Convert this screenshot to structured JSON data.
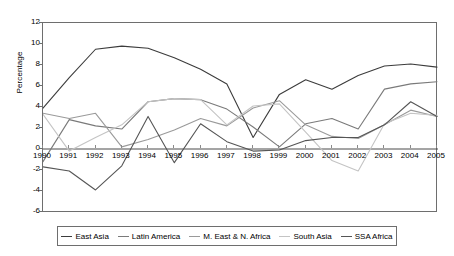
{
  "chart_data": {
    "type": "line",
    "title": "",
    "xlabel": "",
    "ylabel": "Percentage",
    "grid": false,
    "legend_position": "bottom",
    "x": [
      1990,
      1991,
      1992,
      1993,
      1994,
      1995,
      1996,
      1997,
      1998,
      1999,
      2000,
      2001,
      2002,
      2003,
      2004,
      2005
    ],
    "xtick_labels": [
      "1990",
      "1991",
      "1992",
      "1993",
      "1994",
      "1995",
      "1996",
      "1997",
      "1998",
      "1999",
      "2000",
      "2001",
      "2002",
      "2003",
      "2004",
      "2005"
    ],
    "ylim": [
      -6,
      12
    ],
    "ytick_labels": [
      "12",
      "10",
      "8",
      "6",
      "4",
      "2",
      "0",
      "-2",
      "-4",
      "-6"
    ],
    "ytick_values": [
      12,
      10,
      8,
      6,
      4,
      2,
      0,
      -2,
      -4,
      -6
    ],
    "series": [
      {
        "name": "East Asia",
        "color": "#3c3c3c",
        "values": [
          3.9,
          6.8,
          9.5,
          9.8,
          9.6,
          8.7,
          7.6,
          6.2,
          1.1,
          5.2,
          6.6,
          5.7,
          7.0,
          7.9,
          8.1,
          7.8
        ]
      },
      {
        "name": "Latin America",
        "color": "#7a7a7a",
        "values": [
          -1.2,
          2.8,
          2.2,
          1.9,
          4.5,
          4.8,
          4.7,
          3.8,
          2.1,
          0.2,
          2.4,
          2.9,
          1.9,
          5.7,
          6.2,
          6.4
        ]
      },
      {
        "name": "M. East & N. Africa",
        "color": "#9a9a9a",
        "values": [
          3.4,
          2.9,
          3.4,
          0.2,
          0.9,
          1.8,
          2.9,
          2.2,
          3.9,
          4.6,
          2.3,
          1.2,
          1.0,
          2.3,
          3.7,
          3.1
        ]
      },
      {
        "name": "South Asia",
        "color": "#c4c4c4",
        "values": [
          3.3,
          -0.2,
          1.1,
          2.3,
          4.5,
          4.8,
          4.7,
          2.3,
          4.1,
          4.3,
          1.6,
          -1.1,
          -2.1,
          2.4,
          3.4,
          3.2
        ]
      },
      {
        "name": "SSA Africa",
        "color": "#555555",
        "values": [
          -1.7,
          -2.1,
          -3.9,
          -1.6,
          3.1,
          -1.3,
          2.4,
          0.7,
          -0.2,
          -0.1,
          0.8,
          1.1,
          1.1,
          2.3,
          4.5,
          3.1
        ]
      }
    ]
  },
  "axis": {
    "ylabel": "Percentage"
  },
  "legend": {
    "items": [
      {
        "label": "East Asia"
      },
      {
        "label": "Latin America"
      },
      {
        "label": "M. East & N. Africa"
      },
      {
        "label": "South Asia"
      },
      {
        "label": "SSA Africa"
      }
    ]
  }
}
